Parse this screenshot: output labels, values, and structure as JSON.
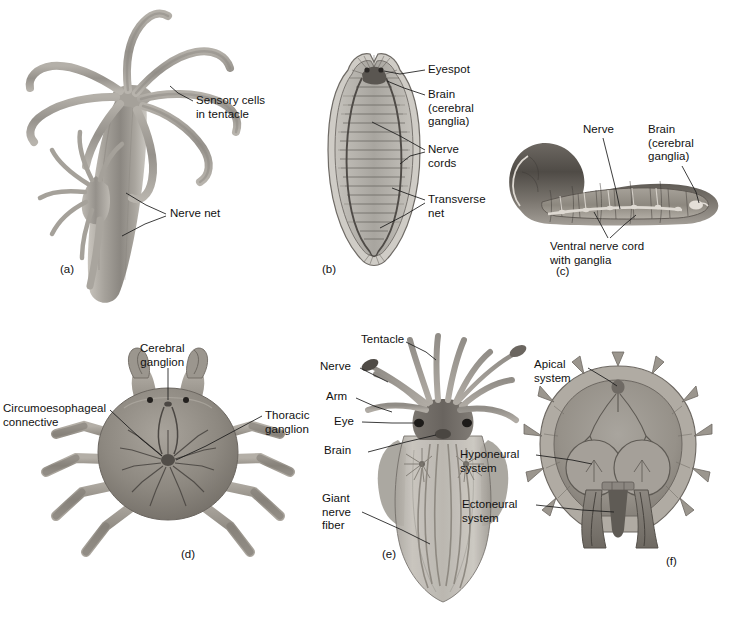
{
  "figure": {
    "background_color": "#ffffff",
    "text_color": "#111111",
    "leader_color": "#1a1a1a"
  },
  "panels": [
    {
      "id": "a",
      "letter": "(a)",
      "organism": "hydra-cnidarian",
      "body_color": "#9a968f",
      "labels": [
        {
          "name": "sensory-cells-in-tentacle",
          "text": "Sensory cells\nin tentacle"
        },
        {
          "name": "nerve-net",
          "text": "Nerve net"
        }
      ]
    },
    {
      "id": "b",
      "letter": "(b)",
      "organism": "flatworm-planarian",
      "body_color": "#a9a6a0",
      "labels": [
        {
          "name": "eyespot",
          "text": "Eyespot"
        },
        {
          "name": "brain-cerebral-ganglia",
          "text": "Brain\n(cerebral\nganglia)"
        },
        {
          "name": "nerve-cords",
          "text": "Nerve\ncords"
        },
        {
          "name": "transverse-net",
          "text": "Transverse\nnet"
        }
      ]
    },
    {
      "id": "c",
      "letter": "(c)",
      "organism": "annelid-earthworm",
      "body_color": "#7e7a74",
      "labels": [
        {
          "name": "nerve",
          "text": "Nerve"
        },
        {
          "name": "brain-cerebral-ganglia",
          "text": "Brain\n(cerebral\nganglia)"
        },
        {
          "name": "ventral-nerve-cord-with-ganglia",
          "text": "Ventral nerve cord\nwith ganglia"
        }
      ]
    },
    {
      "id": "d",
      "letter": "(d)",
      "organism": "crustacean-crab",
      "body_color": "#8d8a85",
      "labels": [
        {
          "name": "cerebral-ganglion",
          "text": "Cerebral\nganglion"
        },
        {
          "name": "circumoesophageal-connective",
          "text": "Circumoesophageal\nconnective"
        },
        {
          "name": "thoracic-ganglion",
          "text": "Thoracic\nganglion"
        }
      ]
    },
    {
      "id": "e",
      "letter": "(e)",
      "organism": "mollusc-squid",
      "body_color": "#93908b",
      "labels": [
        {
          "name": "tentacle",
          "text": "Tentacle"
        },
        {
          "name": "nerve",
          "text": "Nerve"
        },
        {
          "name": "arm",
          "text": "Arm"
        },
        {
          "name": "eye",
          "text": "Eye"
        },
        {
          "name": "brain",
          "text": "Brain"
        },
        {
          "name": "giant-nerve-fiber",
          "text": "Giant\nnerve\nfiber"
        }
      ]
    },
    {
      "id": "f",
      "letter": "(f)",
      "organism": "echinoderm-sea-urchin",
      "body_color": "#9b9892",
      "labels": [
        {
          "name": "apical-system",
          "text": "Apical\nsystem"
        },
        {
          "name": "hyponeural-system",
          "text": "Hyponeural\nsystem"
        },
        {
          "name": "ectoneural-system",
          "text": "Ectoneural\nsystem"
        }
      ]
    }
  ]
}
